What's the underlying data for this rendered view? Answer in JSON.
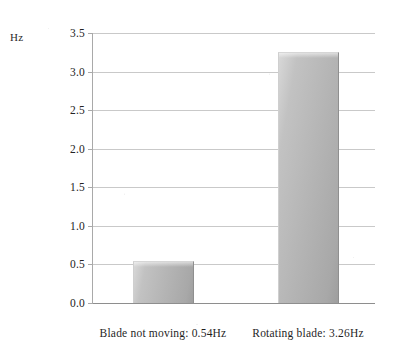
{
  "chart_data": {
    "type": "bar",
    "title": "",
    "subtitle": "",
    "xlabel": "",
    "ylabel": "Hz",
    "categories": [
      "Blade not moving: 0.54Hz",
      "Rotating blade: 3.26Hz"
    ],
    "values": [
      0.54,
      3.26
    ],
    "series": [
      {
        "name": "Frequency",
        "values": [
          0.54,
          3.26
        ]
      }
    ],
    "ylim": [
      0.0,
      3.5
    ],
    "ytick_step": 0.5,
    "ytick_labels": [
      "0.0",
      "0.5",
      "1.0",
      "1.5",
      "2.0",
      "2.5",
      "3.0",
      "3.5"
    ],
    "ytick_values": [
      0.0,
      0.5,
      1.0,
      1.5,
      2.0,
      2.5,
      3.0,
      3.5
    ],
    "grid": {
      "horizontal": true,
      "vertical": false
    },
    "legend": {
      "visible": false,
      "position": "none"
    },
    "annotations": [],
    "bar_color": "#b4b4b4",
    "bar_color_light": "#d8d8d8",
    "bar_color_dark": "#9e9e9e",
    "gridline_color": "#c9c9c9",
    "axis_color": "#8e8e8e",
    "background_color": "#ffffff"
  },
  "axis": {
    "unit_label": "Hz"
  },
  "ticks": [
    {
      "label": "3.5",
      "value": 3.5
    },
    {
      "label": "3.0",
      "value": 3.0
    },
    {
      "label": "2.5",
      "value": 2.5
    },
    {
      "label": "2.0",
      "value": 2.0
    },
    {
      "label": "1.5",
      "value": 1.5
    },
    {
      "label": "1.0",
      "value": 1.0
    },
    {
      "label": "0.5",
      "value": 0.5
    },
    {
      "label": "0.0",
      "value": 0.0
    }
  ],
  "bars": [
    {
      "label": "Blade not moving: 0.54Hz",
      "value": 0.54
    },
    {
      "label": "Rotating blade: 3.26Hz",
      "value": 3.26
    }
  ]
}
